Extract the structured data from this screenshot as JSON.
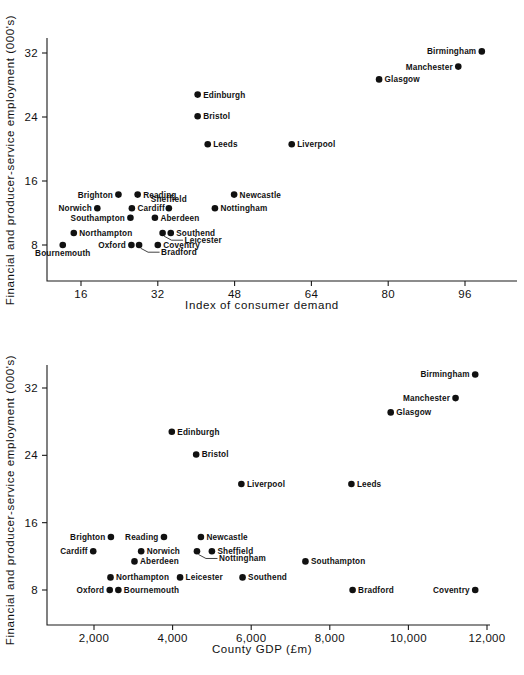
{
  "page": {
    "background_color": "#ffffff",
    "ink_color": "#111111"
  },
  "chart_data": [
    {
      "id": "top",
      "type": "scatter",
      "title": "",
      "xlabel": "Index of consumer demand",
      "ylabel": "Financial and producer-service employment (000's)",
      "xticks": [
        16,
        32,
        48,
        64,
        80,
        96
      ],
      "xtick_labels": [
        "16",
        "32",
        "48",
        "64",
        "80",
        "96"
      ],
      "yticks": [
        8,
        16,
        24,
        32
      ],
      "ytick_labels": [
        "8",
        "16",
        "24",
        "32"
      ],
      "xlim": [
        9,
        103
      ],
      "ylim": [
        5.6,
        34.5
      ],
      "grid": false,
      "legend": "none",
      "points": [
        {
          "label": "Birmingham",
          "x": 99.5,
          "y": 32.2,
          "label_side": "left"
        },
        {
          "label": "Manchester",
          "x": 94.6,
          "y": 30.3,
          "label_side": "left"
        },
        {
          "label": "Glasgow",
          "x": 78.1,
          "y": 28.7,
          "label_side": "right"
        },
        {
          "label": "Edinburgh",
          "x": 40.3,
          "y": 26.8,
          "label_side": "right"
        },
        {
          "label": "Bristol",
          "x": 40.3,
          "y": 24.1,
          "label_side": "right"
        },
        {
          "label": "Leeds",
          "x": 42.4,
          "y": 20.6,
          "label_side": "right"
        },
        {
          "label": "Liverpool",
          "x": 59.9,
          "y": 20.6,
          "label_side": "right"
        },
        {
          "label": "Brighton",
          "x": 23.8,
          "y": 14.3,
          "label_side": "left"
        },
        {
          "label": "Reading",
          "x": 27.8,
          "y": 14.3,
          "label_side": "right"
        },
        {
          "label": "Newcastle",
          "x": 47.9,
          "y": 14.3,
          "label_side": "right"
        },
        {
          "label": "Norwich",
          "x": 19.4,
          "y": 12.6,
          "label_side": "left"
        },
        {
          "label": "Cardiff",
          "x": 26.6,
          "y": 12.6,
          "label_side": "right"
        },
        {
          "label": "Sheffield",
          "x": 34.3,
          "y": 12.6,
          "label_side": "above"
        },
        {
          "label": "Nottingham",
          "x": 43.9,
          "y": 12.6,
          "label_side": "right"
        },
        {
          "label": "Southampton",
          "x": 26.3,
          "y": 11.4,
          "label_side": "left"
        },
        {
          "label": "Aberdeen",
          "x": 31.4,
          "y": 11.4,
          "label_side": "right"
        },
        {
          "label": "Leicester",
          "x": 33.0,
          "y": 9.5,
          "label_side": "leader"
        },
        {
          "label": "Southend",
          "x": 34.7,
          "y": 9.5,
          "label_side": "right"
        },
        {
          "label": "Northampton",
          "x": 14.5,
          "y": 9.5,
          "label_side": "right"
        },
        {
          "label": "Bournemouth",
          "x": 12.2,
          "y": 8.0,
          "label_side": "below"
        },
        {
          "label": "Oxford",
          "x": 26.5,
          "y": 8.0,
          "label_side": "left"
        },
        {
          "label": "Bradford",
          "x": 28.1,
          "y": 8.0,
          "label_side": "leader"
        },
        {
          "label": "Coventry",
          "x": 32.0,
          "y": 8.0,
          "label_side": "right"
        }
      ]
    },
    {
      "id": "bottom",
      "type": "scatter",
      "title": "",
      "xlabel": "County GDP (£m)",
      "ylabel": "Financial and producer-service employment (000's)",
      "xticks": [
        2000,
        4000,
        6000,
        8000,
        10000,
        12000
      ],
      "xtick_labels": [
        "2,000",
        "4,000",
        "6,000",
        "8,000",
        "10,000",
        "12,000"
      ],
      "yticks": [
        8,
        16,
        24,
        32
      ],
      "ytick_labels": [
        "8",
        "16",
        "24",
        "32"
      ],
      "xlim": [
        600,
        12500
      ],
      "ylim": [
        5.6,
        35.0
      ],
      "grid": false,
      "legend": "none",
      "points": [
        {
          "label": "Birmingham",
          "x": 11700,
          "y": 33.6,
          "label_side": "left"
        },
        {
          "label": "Manchester",
          "x": 11200,
          "y": 30.8,
          "label_side": "left"
        },
        {
          "label": "Glasgow",
          "x": 9550,
          "y": 29.1,
          "label_side": "right"
        },
        {
          "label": "Edinburgh",
          "x": 3980,
          "y": 26.8,
          "label_side": "right"
        },
        {
          "label": "Bristol",
          "x": 4600,
          "y": 24.1,
          "label_side": "right"
        },
        {
          "label": "Liverpool",
          "x": 5750,
          "y": 20.6,
          "label_side": "right"
        },
        {
          "label": "Leeds",
          "x": 8550,
          "y": 20.6,
          "label_side": "right"
        },
        {
          "label": "Brighton",
          "x": 2430,
          "y": 14.3,
          "label_side": "left"
        },
        {
          "label": "Reading",
          "x": 3780,
          "y": 14.3,
          "label_side": "left"
        },
        {
          "label": "Newcastle",
          "x": 4720,
          "y": 14.3,
          "label_side": "right"
        },
        {
          "label": "Cardiff",
          "x": 1980,
          "y": 12.6,
          "label_side": "left"
        },
        {
          "label": "Norwich",
          "x": 3200,
          "y": 12.6,
          "label_side": "right"
        },
        {
          "label": "Nottingham",
          "x": 4620,
          "y": 12.6,
          "label_side": "leader"
        },
        {
          "label": "Sheffield",
          "x": 5000,
          "y": 12.6,
          "label_side": "right"
        },
        {
          "label": "Aberdeen",
          "x": 3030,
          "y": 11.4,
          "label_side": "right"
        },
        {
          "label": "Southampton",
          "x": 7380,
          "y": 11.4,
          "label_side": "right"
        },
        {
          "label": "Northampton",
          "x": 2420,
          "y": 9.5,
          "label_side": "right"
        },
        {
          "label": "Leicester",
          "x": 4190,
          "y": 9.5,
          "label_side": "right"
        },
        {
          "label": "Southend",
          "x": 5780,
          "y": 9.5,
          "label_side": "right"
        },
        {
          "label": "Oxford",
          "x": 2400,
          "y": 8.0,
          "label_side": "left"
        },
        {
          "label": "Bournemouth",
          "x": 2620,
          "y": 8.0,
          "label_side": "right"
        },
        {
          "label": "Bradford",
          "x": 8580,
          "y": 8.0,
          "label_side": "right"
        },
        {
          "label": "Coventry",
          "x": 11700,
          "y": 8.0,
          "label_side": "left"
        }
      ]
    }
  ]
}
